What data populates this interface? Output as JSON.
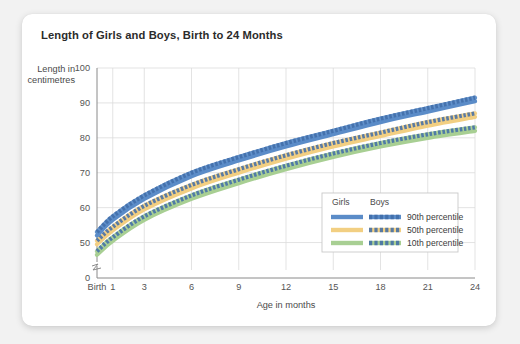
{
  "card": {
    "title": "Length of Girls and Boys, Birth to 24 Months"
  },
  "axes": {
    "y_title_line1": "Length in",
    "y_title_line2": "centimetres",
    "x_title": "Age in months",
    "y_ticks": [
      "100",
      "90",
      "80",
      "70",
      "60",
      "50",
      "0"
    ],
    "x_ticks": [
      "Birth",
      "1",
      "3",
      "6",
      "9",
      "12",
      "15",
      "18",
      "21",
      "24"
    ]
  },
  "legend": {
    "col_girls": "Girls",
    "col_boys": "Boys",
    "rows": [
      {
        "label": "90th percentile",
        "color": "#5b8cc8"
      },
      {
        "label": "50th percentile",
        "color": "#f2cf82"
      },
      {
        "label": "10th percentile",
        "color": "#a8cf93"
      }
    ]
  },
  "colors": {
    "p90": "#5b8cc8",
    "p50": "#f2cf82",
    "p10": "#a8cf93",
    "boys_dash_tint": "#3f6ca8",
    "grid": "#dcdcdc",
    "axis": "#8a8a8a",
    "card_bg": "#ffffff",
    "page_bg": "#f2f2f2"
  },
  "chart_data": {
    "type": "line",
    "title": "Length of Girls and Boys, Birth to 24 Months",
    "xlabel": "Age in months",
    "ylabel": "Length in centimetres",
    "xlim": [
      0,
      24
    ],
    "ylim": [
      45,
      100
    ],
    "y_axis_break": true,
    "y_break_below": 45,
    "grid": true,
    "legend_position": "inside-bottom-right",
    "x": [
      0,
      1,
      3,
      6,
      9,
      12,
      15,
      18,
      21,
      24
    ],
    "series": [
      {
        "name": "Girls 90th percentile",
        "group": "Girls",
        "percentile": 90,
        "style": "solid",
        "color": "#5b8cc8",
        "values": [
          52.0,
          56.5,
          62.5,
          69.0,
          73.5,
          77.5,
          81.0,
          84.5,
          87.5,
          90.5
        ]
      },
      {
        "name": "Boys 90th percentile",
        "group": "Boys",
        "percentile": 90,
        "style": "dashed",
        "color": "#5b8cc8",
        "values": [
          53.0,
          57.5,
          63.5,
          70.0,
          74.5,
          78.5,
          82.0,
          85.5,
          88.5,
          91.5
        ]
      },
      {
        "name": "Girls 50th percentile",
        "group": "Girls",
        "percentile": 50,
        "style": "solid",
        "color": "#f2cf82",
        "values": [
          49.5,
          53.5,
          59.5,
          65.5,
          70.0,
          74.0,
          77.5,
          80.5,
          83.5,
          86.0
        ]
      },
      {
        "name": "Boys 50th percentile",
        "group": "Boys",
        "percentile": 50,
        "style": "dashed",
        "color": "#f2cf82",
        "values": [
          50.5,
          54.5,
          60.5,
          66.5,
          71.0,
          75.0,
          78.5,
          81.5,
          84.5,
          87.0
        ]
      },
      {
        "name": "Girls 10th percentile",
        "group": "Girls",
        "percentile": 10,
        "style": "solid",
        "color": "#a8cf93",
        "values": [
          46.5,
          50.5,
          56.5,
          62.5,
          67.0,
          71.0,
          74.5,
          77.5,
          80.0,
          82.0
        ]
      },
      {
        "name": "Boys 10th percentile",
        "group": "Boys",
        "percentile": 10,
        "style": "dashed",
        "color": "#a8cf93",
        "values": [
          47.5,
          51.5,
          57.5,
          63.5,
          68.0,
          72.0,
          75.5,
          78.5,
          81.0,
          83.0
        ]
      }
    ]
  }
}
